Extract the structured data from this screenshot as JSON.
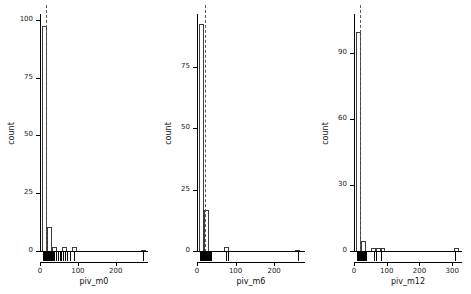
{
  "figure": {
    "ylabel": "count",
    "style": {
      "bar_edge": "#3c3c3c",
      "bar_fill": "#ffffff",
      "axis": "#000000",
      "refline": "#5a5a5a",
      "background": "#ffffff"
    }
  },
  "chart_data": [
    {
      "type": "bar",
      "title": "",
      "xlabel": "piv_m0",
      "ylabel": "count",
      "xlim": [
        0,
        285
      ],
      "ylim": [
        0,
        103
      ],
      "grid": false,
      "legend": false,
      "xticks": [
        0,
        100,
        200
      ],
      "yticks": [
        0,
        25,
        50,
        75,
        100
      ],
      "bin_width": 13,
      "bin_starts": [
        6,
        19,
        32,
        45,
        58,
        71,
        84,
        97,
        110,
        123,
        136,
        149,
        162,
        175,
        188,
        201,
        214,
        227,
        240,
        253,
        266
      ],
      "values": [
        98,
        11,
        2,
        0,
        2,
        0,
        2,
        0,
        0,
        0,
        0,
        0,
        0,
        0,
        0,
        0,
        0,
        0,
        0,
        0,
        1
      ],
      "reference_line_x": 17,
      "rug_values": [
        9,
        11,
        12,
        13,
        14,
        15,
        16,
        17,
        18,
        19,
        20,
        21,
        22,
        23,
        24,
        25,
        26,
        27,
        28,
        29,
        30,
        31,
        33,
        35,
        38,
        42,
        48,
        52,
        56,
        62,
        66,
        70,
        78,
        90,
        272
      ]
    },
    {
      "type": "bar",
      "title": "",
      "xlabel": "piv_m6",
      "ylabel": "count",
      "xlim": [
        0,
        280
      ],
      "ylim": [
        0,
        97
      ],
      "grid": false,
      "legend": false,
      "xticks": [
        0,
        100,
        200
      ],
      "yticks": [
        0,
        25,
        50,
        75
      ],
      "bin_width": 13,
      "bin_starts": [
        6,
        19,
        32,
        45,
        58,
        71,
        84,
        97,
        110,
        123,
        136,
        149,
        162,
        175,
        188,
        201,
        214,
        227,
        240,
        253
      ],
      "values": [
        93,
        17,
        0,
        0,
        0,
        2,
        0,
        0,
        0,
        0,
        0,
        0,
        0,
        0,
        0,
        0,
        0,
        0,
        0,
        1
      ],
      "reference_line_x": 20,
      "rug_values": [
        8,
        10,
        12,
        14,
        15,
        16,
        17,
        18,
        19,
        20,
        21,
        22,
        23,
        24,
        25,
        26,
        27,
        28,
        29,
        30,
        32,
        34,
        36,
        74,
        80,
        262
      ]
    },
    {
      "type": "bar",
      "title": "",
      "xlabel": "piv_m12",
      "ylabel": "count",
      "xlim": [
        0,
        330
      ],
      "ylim": [
        0,
        108
      ],
      "grid": false,
      "legend": false,
      "xticks": [
        0,
        100,
        200,
        300
      ],
      "yticks": [
        0,
        30,
        60,
        90
      ],
      "bin_width": 15,
      "bin_starts": [
        6,
        21,
        36,
        51,
        66,
        81,
        96,
        111,
        126,
        141,
        156,
        171,
        186,
        201,
        216,
        231,
        246,
        261,
        276,
        291,
        306
      ],
      "values": [
        100,
        5,
        0,
        2,
        2,
        2,
        0,
        0,
        0,
        0,
        0,
        0,
        0,
        0,
        0,
        0,
        0,
        0,
        0,
        0,
        2
      ],
      "reference_line_x": 18,
      "rug_values": [
        9,
        12,
        14,
        15,
        16,
        17,
        18,
        19,
        20,
        21,
        22,
        23,
        24,
        25,
        26,
        27,
        28,
        30,
        33,
        36,
        62,
        66,
        84,
        308
      ]
    }
  ]
}
